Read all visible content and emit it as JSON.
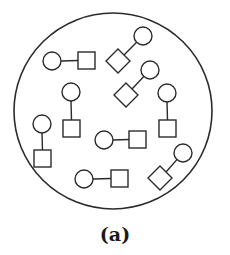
{
  "figure": {
    "caption": "(a)",
    "stroke_color": "#2b2b2b",
    "background": "#ffffff",
    "container": {
      "shape": "circle",
      "cx": 113,
      "cy": 111,
      "rx": 99,
      "ry": 98
    },
    "pairs": [
      {
        "id": "pair-1",
        "orientation": "horizontal",
        "circle": {
          "cx": 52,
          "cy": 61,
          "r": 9
        },
        "partner": "square",
        "partner_pos": {
          "x": 78,
          "y": 52,
          "size": 17
        }
      },
      {
        "id": "pair-2",
        "orientation": "diagonal",
        "circle": {
          "cx": 143,
          "cy": 36,
          "r": 9
        },
        "partner": "diamond",
        "partner_pos": {
          "cx": 118,
          "cy": 61,
          "half": 12
        }
      },
      {
        "id": "pair-3",
        "orientation": "diagonal",
        "circle": {
          "cx": 150,
          "cy": 70,
          "r": 9
        },
        "partner": "diamond",
        "partner_pos": {
          "cx": 126,
          "cy": 95,
          "half": 12
        }
      },
      {
        "id": "pair-4",
        "orientation": "vertical",
        "circle": {
          "cx": 71,
          "cy": 92,
          "r": 9
        },
        "partner": "square",
        "partner_pos": {
          "x": 63,
          "y": 120,
          "size": 17
        }
      },
      {
        "id": "pair-5",
        "orientation": "vertical",
        "circle": {
          "cx": 167,
          "cy": 93,
          "r": 9
        },
        "partner": "square",
        "partner_pos": {
          "x": 159,
          "y": 120,
          "size": 17
        }
      },
      {
        "id": "pair-6",
        "orientation": "vertical",
        "circle": {
          "cx": 42,
          "cy": 124,
          "r": 9
        },
        "partner": "square",
        "partner_pos": {
          "x": 34,
          "y": 150,
          "size": 17
        }
      },
      {
        "id": "pair-7",
        "orientation": "horizontal",
        "circle": {
          "cx": 104,
          "cy": 140,
          "r": 9
        },
        "partner": "square",
        "partner_pos": {
          "x": 129,
          "y": 131,
          "size": 17
        }
      },
      {
        "id": "pair-8",
        "orientation": "horizontal",
        "circle": {
          "cx": 84,
          "cy": 179,
          "r": 9
        },
        "partner": "square",
        "partner_pos": {
          "x": 111,
          "y": 170,
          "size": 17
        }
      },
      {
        "id": "pair-9",
        "orientation": "diagonal",
        "circle": {
          "cx": 183,
          "cy": 153,
          "r": 9
        },
        "partner": "diamond",
        "partner_pos": {
          "cx": 160,
          "cy": 178,
          "half": 12
        }
      }
    ]
  }
}
